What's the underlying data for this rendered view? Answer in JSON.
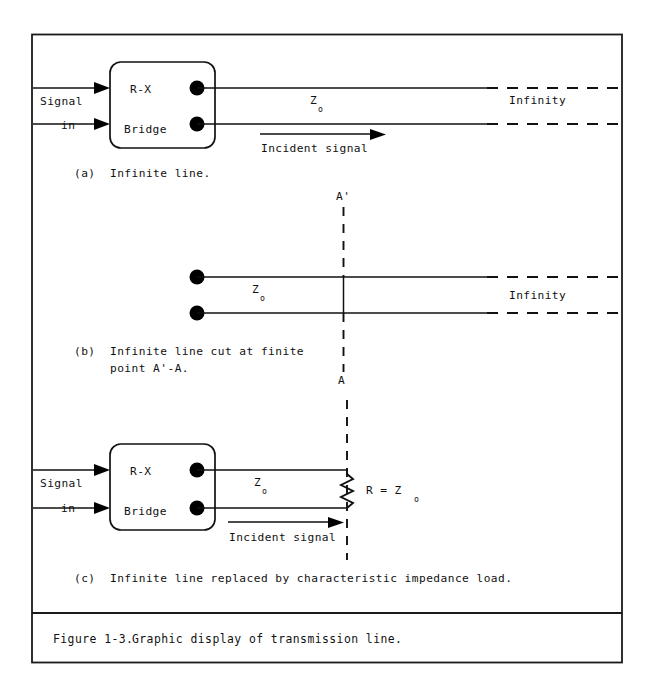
{
  "figure": {
    "number": "Figure 1-3.",
    "caption": "Graphic display of transmission line."
  },
  "panel_a": {
    "id": "(a)",
    "caption": "Infinite line.",
    "signal_label_line1": "Signal",
    "signal_label_line2": "in",
    "box_label_line1": "R-X",
    "box_label_line2": "Bridge",
    "impedance_symbol": "Z",
    "impedance_subscript": "o",
    "far_end_label": "Infinity",
    "incident_label": "Incident signal"
  },
  "panel_b": {
    "id": "(b)",
    "caption_line1": "Infinite line cut at finite",
    "caption_line2": "point A'-A.",
    "impedance_symbol": "Z",
    "impedance_subscript": "o",
    "far_end_label": "Infinity",
    "cut_label_top": "A'",
    "cut_label_bottom": "A"
  },
  "panel_c": {
    "id": "(c)",
    "caption": "Infinite line replaced by characteristic impedance load.",
    "signal_label_line1": "Signal",
    "signal_label_line2": "in",
    "box_label_line1": "R-X",
    "box_label_line2": "Bridge",
    "impedance_symbol": "Z",
    "impedance_subscript": "o",
    "incident_label": "Incident signal",
    "load_label": "R = Z",
    "load_subscript": "o"
  },
  "colors": {
    "ink": "#111111",
    "paper": "#ffffff",
    "border": "#1a1a1a"
  }
}
